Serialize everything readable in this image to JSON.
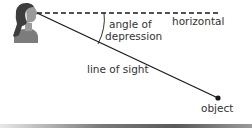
{
  "diagram": {
    "title": "Angle of depression",
    "labels": {
      "angle_line1": "angle of",
      "angle_line2": "depression",
      "horizontal": "horizontal",
      "line_of_sight": "line of sight",
      "object": "object"
    },
    "observer": {
      "icon": "person-profile-icon",
      "eye": [
        37,
        13
      ]
    },
    "horizontal_line": {
      "style": "dashed",
      "from": [
        37,
        13
      ],
      "to": [
        221,
        13
      ]
    },
    "sight_line": {
      "style": "solid",
      "from": [
        37,
        13
      ],
      "to": [
        218,
        98
      ]
    },
    "object_point": [
      218,
      98
    ],
    "colors": {
      "line": "#1a1a1a",
      "text": "#333333",
      "hair": "#3d3d3d",
      "skin": "#9a9a9a",
      "shirt": "#7c7c7c"
    }
  }
}
